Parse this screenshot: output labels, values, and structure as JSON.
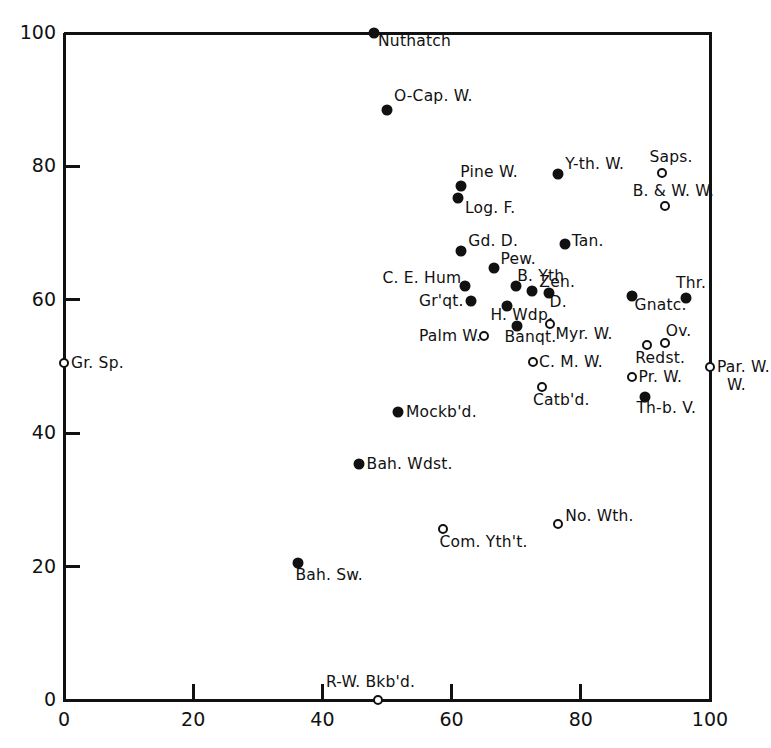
{
  "chart_data": {
    "type": "scatter",
    "title": "",
    "xlabel": "",
    "ylabel": "",
    "xlim": [
      0,
      100
    ],
    "ylim": [
      0,
      100
    ],
    "xticks": [
      0,
      20,
      40,
      60,
      80,
      100
    ],
    "yticks": [
      0,
      20,
      40,
      60,
      80,
      100
    ],
    "xtick_labels": [
      "0",
      "20",
      "40",
      "60",
      "80",
      "100"
    ],
    "ytick_labels": [
      "0",
      "20",
      "40",
      "60",
      "80",
      "100"
    ],
    "grid": false,
    "legend": "none",
    "marker_kinds": [
      "filled",
      "open"
    ],
    "points": [
      {
        "label": "Nuthatch",
        "x": 48.0,
        "y": 100.0,
        "marker": "filled",
        "lx": 4,
        "ly": 9
      },
      {
        "label": "O-Cap. W.",
        "x": 50.0,
        "y": 88.5,
        "marker": "filled",
        "lx": 7,
        "ly": -13
      },
      {
        "label": "Saps.",
        "x": 92.5,
        "y": 79.0,
        "marker": "open",
        "lx": -12,
        "ly": -15
      },
      {
        "label": "Y-th. W.",
        "x": 76.5,
        "y": 78.8,
        "marker": "filled",
        "lx": 7,
        "ly": -9
      },
      {
        "label": "Pine W.",
        "x": 61.5,
        "y": 77.0,
        "marker": "filled",
        "lx": -1,
        "ly": -13
      },
      {
        "label": "B. & W. W.",
        "x": 93.0,
        "y": 74.0,
        "marker": "open",
        "lx": -32,
        "ly": -14
      },
      {
        "label": "Log. F.",
        "x": 61.0,
        "y": 75.3,
        "marker": "filled",
        "lx": 7,
        "ly": 11
      },
      {
        "label": "Tan.",
        "x": 77.5,
        "y": 68.3,
        "marker": "filled",
        "lx": 7,
        "ly": -2
      },
      {
        "label": "Gd. D.",
        "x": 61.5,
        "y": 67.3,
        "marker": "filled",
        "lx": 7,
        "ly": -9
      },
      {
        "label": "Pew.",
        "x": 66.5,
        "y": 64.8,
        "marker": "filled",
        "lx": 7,
        "ly": -8
      },
      {
        "label": "C. E. Hum.",
        "x": 62.0,
        "y": 62.0,
        "marker": "filled",
        "lx": -82,
        "ly": -7
      },
      {
        "label": "B. Yth",
        "x": 70.0,
        "y": 62.0,
        "marker": "filled",
        "lx": 1,
        "ly": -9
      },
      {
        "label": "Zen.",
        "x": 72.5,
        "y": 61.3,
        "marker": "filled",
        "lx": 7,
        "ly": -8
      },
      {
        "label": "D.",
        "x": 75.0,
        "y": 61.0,
        "marker": "filled",
        "lx": 1,
        "ly": 10
      },
      {
        "label": "Thr.",
        "x": 96.3,
        "y": 60.3,
        "marker": "filled",
        "lx": -10,
        "ly": -14
      },
      {
        "label": "Gnatc.",
        "x": 88.0,
        "y": 60.5,
        "marker": "filled",
        "lx": 2,
        "ly": 10
      },
      {
        "label": "Gr'qt.",
        "x": 63.0,
        "y": 59.8,
        "marker": "filled",
        "lx": -52,
        "ly": 1
      },
      {
        "label": "H. Wdp.",
        "x": 68.5,
        "y": 59.0,
        "marker": "filled",
        "lx": -16,
        "ly": 10
      },
      {
        "label": "Banqt.",
        "x": 70.2,
        "y": 56.0,
        "marker": "filled",
        "lx": -13,
        "ly": 12
      },
      {
        "label": "Myr. W.",
        "x": 75.3,
        "y": 56.4,
        "marker": "open",
        "lx": 5,
        "ly": 11
      },
      {
        "label": "Palm W.",
        "x": 65.0,
        "y": 54.5,
        "marker": "open",
        "lx": -65,
        "ly": 1
      },
      {
        "label": "Ov.",
        "x": 93.0,
        "y": 53.5,
        "marker": "open",
        "lx": 1,
        "ly": -11
      },
      {
        "label": "Redst.",
        "x": 90.3,
        "y": 53.2,
        "marker": "open",
        "lx": -12,
        "ly": 14
      },
      {
        "label": "C. M. W.",
        "x": 72.6,
        "y": 50.7,
        "marker": "open",
        "lx": 6,
        "ly": 1
      },
      {
        "label": "Gr. Sp.",
        "x": 0.0,
        "y": 50.5,
        "marker": "open",
        "lx": 7,
        "ly": 1
      },
      {
        "label": "Par. W.",
        "x": 100.0,
        "y": 50.0,
        "marker": "open",
        "lx": 7,
        "ly": 1
      },
      {
        "label": "Pr. W.",
        "x": 88.0,
        "y": 48.5,
        "marker": "open",
        "lx": 6,
        "ly": 1
      },
      {
        "label": "Catb'd.",
        "x": 74.0,
        "y": 47.0,
        "marker": "open",
        "lx": -9,
        "ly": 14
      },
      {
        "label": "Th-b. V.",
        "x": 90.0,
        "y": 45.5,
        "marker": "filled",
        "lx": -9,
        "ly": 12
      },
      {
        "label": "Mockb'd.",
        "x": 51.7,
        "y": 43.2,
        "marker": "filled",
        "lx": 8,
        "ly": 1
      },
      {
        "label": "Bah. Wdst.",
        "x": 45.6,
        "y": 35.4,
        "marker": "filled",
        "lx": 8,
        "ly": 1
      },
      {
        "label": "No. Wth.",
        "x": 76.5,
        "y": 26.4,
        "marker": "open",
        "lx": 7,
        "ly": -7
      },
      {
        "label": "Com. Yth't.",
        "x": 58.6,
        "y": 25.6,
        "marker": "open",
        "lx": -3,
        "ly": 14
      },
      {
        "label": "Bah. Sw.",
        "x": 36.3,
        "y": 20.5,
        "marker": "filled",
        "lx": -3,
        "ly": 13
      },
      {
        "label": "R-W. Bkb'd.",
        "x": 48.6,
        "y": 0.0,
        "marker": "open",
        "lx": -52,
        "ly": -17
      }
    ]
  },
  "axes": {
    "left_px": 64,
    "right_px": 710,
    "bottom_px": 700,
    "top_px": 33
  },
  "par_w_second_line": "W."
}
